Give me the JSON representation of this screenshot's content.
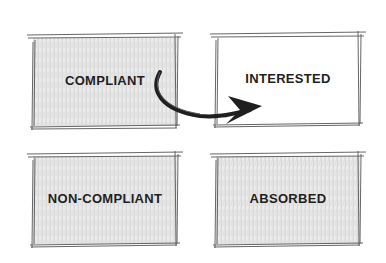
{
  "diagram": {
    "boxes": [
      {
        "id": "compliant",
        "label": "Compliant",
        "shaded": true
      },
      {
        "id": "interested",
        "label": "Interested",
        "shaded": false
      },
      {
        "id": "non_compliant",
        "label": "Non-compliant",
        "shaded": true
      },
      {
        "id": "absorbed",
        "label": "Absorbed",
        "shaded": true
      }
    ],
    "arrows": [
      {
        "from": "compliant",
        "to": "interested"
      }
    ],
    "colors": {
      "ink": "#1f1f1f",
      "shade": "#d9d9d9",
      "background": "#ffffff"
    }
  }
}
